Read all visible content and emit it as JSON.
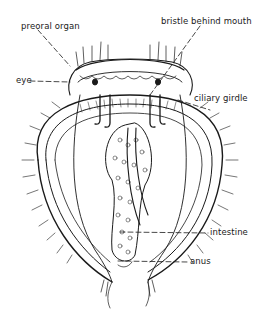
{
  "diagram": {
    "labels": [
      {
        "id": "preoral_organ",
        "text": "preoral organ"
      },
      {
        "id": "bristle_behind_mouth",
        "text": "bristle behind mouth"
      },
      {
        "id": "eye",
        "text": "eye"
      },
      {
        "id": "ciliary_girdle",
        "text": "ciliary girdle"
      },
      {
        "id": "intestine",
        "text": "intestine"
      },
      {
        "id": "anus",
        "text": "anus"
      }
    ],
    "colors": {
      "line": "#1a1a1a",
      "background": "#ffffff"
    }
  }
}
